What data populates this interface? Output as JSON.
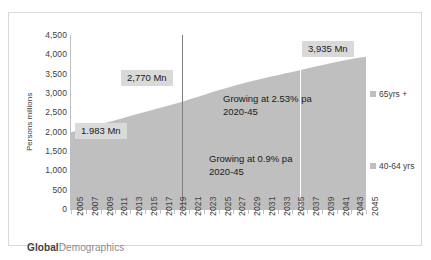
{
  "chart_data": {
    "type": "area",
    "title": "",
    "subtitle": "",
    "xlabel": "",
    "ylabel": "Persons millions",
    "ylim": [
      0,
      4500
    ],
    "ytick_values": [
      4500,
      4000,
      3500,
      3000,
      2500,
      2000,
      1500,
      1000,
      500,
      0
    ],
    "ytick_labels": [
      "4,500",
      "4,000",
      "3,500",
      "3,000",
      "2,500",
      "2,000",
      "1,500",
      "1,000",
      "500",
      "0"
    ],
    "grid": false,
    "legend_position": "right",
    "x": [
      2005,
      2006,
      2007,
      2008,
      2009,
      2010,
      2011,
      2012,
      2013,
      2014,
      2015,
      2016,
      2017,
      2018,
      2019,
      2020,
      2021,
      2022,
      2023,
      2024,
      2025,
      2026,
      2027,
      2028,
      2029,
      2030,
      2031,
      2032,
      2033,
      2034,
      2035,
      2036,
      2037,
      2038,
      2039,
      2040,
      2041,
      2042,
      2043,
      2044,
      2045
    ],
    "xtick_labels": [
      "2005",
      "2007",
      "2009",
      "2011",
      "2013",
      "2015",
      "2017",
      "2019",
      "2021",
      "2023",
      "2025",
      "2027",
      "2029",
      "2031",
      "2033",
      "2035",
      "2037",
      "2039",
      "2041",
      "2043",
      "2045"
    ],
    "series": [
      {
        "name": "65yrs +",
        "color": "#bfbfbf",
        "values": [
          1983,
          2035,
          2088,
          2140,
          2193,
          2245,
          2298,
          2350,
          2403,
          2455,
          2508,
          2560,
          2613,
          2665,
          2718,
          2770,
          2830,
          2890,
          2950,
          3010,
          3068,
          3125,
          3180,
          3232,
          3282,
          3330,
          3376,
          3420,
          3462,
          3502,
          3540,
          3588,
          3634,
          3678,
          3720,
          3760,
          3800,
          3840,
          3880,
          3910,
          3935
        ]
      }
    ],
    "annotations": [
      {
        "id": "start-value",
        "text": "1.983 Mn",
        "x": 2005,
        "y": 2000,
        "style": "box"
      },
      {
        "id": "mid-value",
        "text": "2,770 Mn",
        "x": 2014,
        "y": 3450,
        "style": "box"
      },
      {
        "id": "end-value",
        "text": "3,935 Mn",
        "x": 2038,
        "y": 4180,
        "style": "box"
      },
      {
        "id": "growth-upper",
        "text": "Growing at 2.53% pa",
        "text2": "2020-45",
        "x": 2028,
        "y": 2950,
        "style": "plain"
      },
      {
        "id": "growth-lower",
        "text": "Growing at 0.9% pa",
        "text2": "2020-45",
        "x": 2027,
        "y": 1450,
        "style": "plain"
      }
    ],
    "vlines": [
      {
        "id": "vline-2020",
        "x": 2020,
        "color": "#7f7f7f"
      },
      {
        "id": "vline-2036",
        "x": 2036,
        "color": "#ffffff"
      }
    ]
  },
  "legend": {
    "items": [
      {
        "label": "65yrs +",
        "color": "#bfbfbf"
      },
      {
        "label": "40-64 yrs",
        "color": "#bfbfbf"
      }
    ]
  },
  "axis": {
    "y_title": "Persons millions"
  },
  "footer": {
    "brand_bold": "Global",
    "brand_light": "Demographics"
  }
}
